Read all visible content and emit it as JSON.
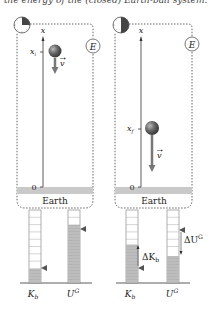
{
  "caption": "the energy of the (closed) Earth-ball system.",
  "panels": [
    {
      "clock_fraction": 0.25,
      "axis_label": "x",
      "position_label": "x",
      "position_sub": "i",
      "velocity_label": "v",
      "system_label": "E",
      "origin_label": "0",
      "ground_label": "Earth"
    },
    {
      "clock_fraction": 0.5,
      "axis_label": "x",
      "position_label": "x",
      "position_sub": "f",
      "velocity_label": "v",
      "system_label": "E",
      "origin_label": "0",
      "ground_label": "Earth"
    }
  ],
  "bar_charts": [
    {
      "bars": [
        {
          "label": "K",
          "sub": "b",
          "segments": 10,
          "filled": 2
        },
        {
          "label": "U",
          "sup": "G",
          "segments": 10,
          "filled": 8
        }
      ]
    },
    {
      "bars": [
        {
          "label": "K",
          "sub": "b",
          "segments": 10,
          "filled": 5.5,
          "initial_marker": 2,
          "delta_label": "ΔK",
          "delta_sub": "b"
        },
        {
          "label": "U",
          "sup": "G",
          "segments": 10,
          "filled": 3.5,
          "initial_marker": 8,
          "delta_label": "ΔU",
          "delta_sup": "G"
        }
      ]
    }
  ],
  "colors": {
    "line": "#333333",
    "dotted": "#666666",
    "earth_band": "#c8c8c8",
    "bar_fill": "#b5b5b5",
    "bar_stripe": "#9a9a9a",
    "ball": "#555555",
    "arrow": "#777777",
    "clock_fill": "#333333"
  }
}
